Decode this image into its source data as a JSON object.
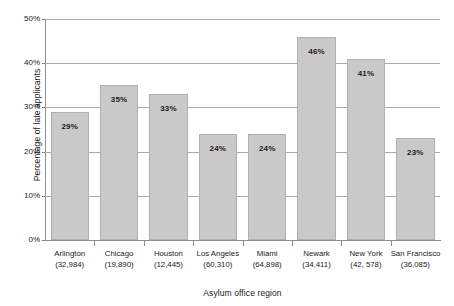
{
  "chart_data": {
    "type": "bar",
    "title": "",
    "xlabel": "Asylum office region",
    "ylabel": "Percentage of late applicants",
    "categories": [
      "Arlington",
      "Chicago",
      "Houston",
      "Los Angeles",
      "Miami",
      "Newark",
      "New York",
      "San Francisco"
    ],
    "category_counts": [
      "(32,984)",
      "(19,890)",
      "(12,445)",
      "(60,310)",
      "(64,898)",
      "(34,411)",
      "(42, 578)",
      "(36,085)"
    ],
    "values": [
      29,
      35,
      33,
      24,
      24,
      46,
      41,
      23
    ],
    "value_labels": [
      "29%",
      "35%",
      "33%",
      "24%",
      "24%",
      "46%",
      "41%",
      "23%"
    ],
    "ylim": [
      0,
      50
    ],
    "yticks": [
      0,
      10,
      20,
      30,
      40,
      50
    ],
    "ytick_labels": [
      "0%",
      "10%",
      "20%",
      "30%",
      "40%",
      "50%"
    ],
    "grid": true,
    "legend": "none",
    "bar_color": "#c9c9c9",
    "bar_border_color": "#b0b0b0",
    "axis_color": "#8f8f8f",
    "gridline_color": "#a9a9a9",
    "text_color": "#1a1a1a",
    "background": "#ffffff"
  }
}
